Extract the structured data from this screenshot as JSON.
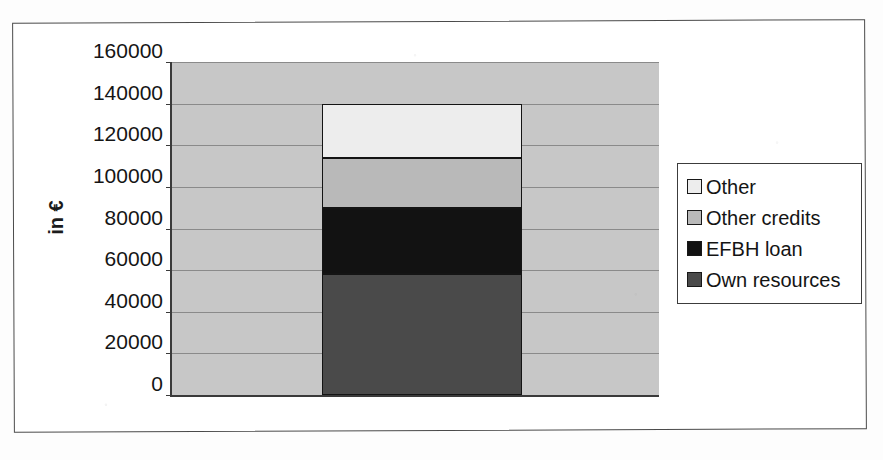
{
  "chart_data": {
    "type": "bar",
    "subtype": "stacked-column",
    "title": "",
    "xlabel": "",
    "ylabel": "in €",
    "categories": [
      ""
    ],
    "ylim": [
      0,
      160000
    ],
    "ytick_labels": [
      "0",
      "20000",
      "40000",
      "60000",
      "80000",
      "100000",
      "120000",
      "140000",
      "160000"
    ],
    "ytick_values": [
      0,
      20000,
      40000,
      60000,
      80000,
      100000,
      120000,
      140000,
      160000
    ],
    "grid": true,
    "legend_position": "right",
    "total": 140000,
    "stack_order_bottom_to_top": [
      "Own resources",
      "EFBH loan",
      "Other credits",
      "Other"
    ],
    "series": [
      {
        "name": "Own resources",
        "values": [
          58000
        ],
        "start": 0,
        "end": 58000,
        "color": "#4a4a4a"
      },
      {
        "name": "EFBH loan",
        "values": [
          32000
        ],
        "start": 58000,
        "end": 90000,
        "color": "#121212"
      },
      {
        "name": "Other credits",
        "values": [
          24000
        ],
        "start": 90000,
        "end": 114000,
        "color": "#b9b9b9"
      },
      {
        "name": "Other",
        "values": [
          26000
        ],
        "start": 114000,
        "end": 140000,
        "color": "#ededed"
      }
    ]
  },
  "legend": {
    "entries": [
      {
        "label": "Other",
        "color": "#ededed"
      },
      {
        "label": "Other credits",
        "color": "#b9b9b9"
      },
      {
        "label": "EFBH loan",
        "color": "#121212"
      },
      {
        "label": "Own resources",
        "color": "#4a4a4a"
      }
    ]
  },
  "axis": {
    "y_title": "in €"
  },
  "style": {
    "plot_background": "#c7c7c7",
    "gridline_color": "#8a8a8a",
    "axis_color": "#3a3a3a",
    "frame_color": "#4a4a4a"
  }
}
